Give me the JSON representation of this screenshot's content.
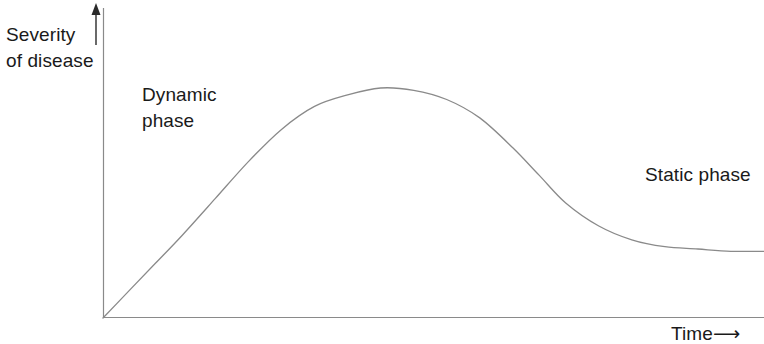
{
  "figure": {
    "background_color": "#ffffff",
    "line_color": "#8a8a8a",
    "text_color": "#1a1a1a"
  },
  "axes": {
    "y_axis_label_line1": "Severity",
    "y_axis_label_line2": "of disease",
    "y_axis_arrow": "up-arrow",
    "x_axis_label": "Time",
    "x_axis_arrow": "⟶"
  },
  "annotations": {
    "dynamic_line1": "Dynamic",
    "dynamic_line2": "phase",
    "static": "Static phase"
  },
  "chart_data": {
    "type": "line",
    "title": "",
    "subtitle": "",
    "xlabel": "Time",
    "ylabel": "Severity of disease",
    "xlim": [
      0,
      100
    ],
    "ylim": [
      0,
      100
    ],
    "grid": false,
    "legend": "none",
    "axis_style": "arrow-terminated, no tick marks, no tick labels",
    "tick_labels_x": [],
    "tick_labels_y": [],
    "series": [
      {
        "name": "Disease progress curve",
        "color": "#8a8a8a",
        "x": [
          0,
          4,
          8,
          12,
          17,
          22,
          27,
          32,
          37,
          42,
          47,
          52,
          57,
          62,
          66,
          70,
          75,
          80,
          85,
          90,
          95,
          100
        ],
        "y": [
          0,
          12,
          24,
          36,
          52,
          68,
          82,
          92,
          97,
          100,
          99,
          95,
          87,
          74,
          62,
          50,
          40,
          34,
          31,
          30,
          29,
          29
        ]
      }
    ],
    "annotations": [
      {
        "text": "Dynamic phase",
        "x": 8,
        "y": 75,
        "describes": "rising limb of the curve from origin to peak"
      },
      {
        "text": "Static phase",
        "x": 85,
        "y": 45,
        "describes": "flat plateau tail of the curve on the right"
      }
    ],
    "features": {
      "peak_x": 32,
      "peak_y": 100,
      "plateau_level_y": 29,
      "starts_at_origin": true
    }
  }
}
